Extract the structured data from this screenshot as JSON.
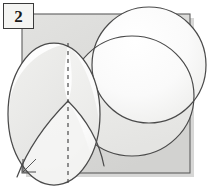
{
  "figure": {
    "label": "2",
    "caption": "",
    "canvas": {
      "width": 212,
      "height": 195,
      "background": "#ffffff"
    }
  },
  "label_box": {
    "text": "2",
    "fill": "#f4f4f2",
    "stroke": "#3a3a3a",
    "x": 3,
    "y": 3,
    "width": 31,
    "height": 26
  },
  "colors": {
    "square_fill": "#dcdcda",
    "square_stroke": "#5a5a5a",
    "square_shadow": "#9a9a98",
    "sphere_fill": "#fbfbfb",
    "sphere_fill_shaded": "#eeeeec",
    "sphere_fill_shaded_2": "#e6e6e4",
    "outline": "#4a4a4a",
    "dashed_line": "#444444",
    "paper": "#ffffff"
  },
  "shapes": {
    "square": {
      "name": "background-square",
      "x": 22,
      "y": 14,
      "width": 168,
      "height": 159,
      "fill": "#dcdcda",
      "stroke": "#5a5a5a"
    },
    "right_angle_mark": {
      "name": "right-angle-mark",
      "vertex_x": 23,
      "vertex_y": 172,
      "size": 13
    },
    "left_sphere": {
      "name": "left-sphere",
      "cx": 54,
      "cy": 114,
      "rx": 46,
      "ry": 71,
      "fill": "#fbfbfb",
      "stroke": "#4a4a4a"
    },
    "right_sphere": {
      "name": "right-sphere",
      "cx": 149,
      "cy": 65,
      "rx": 57,
      "ry": 58,
      "fill": "#fcfcfc",
      "stroke": "#4a4a4a"
    },
    "lower_right_arc_sphere": {
      "name": "lower-right-arc-sphere",
      "cx": 132,
      "cy": 96,
      "rx": 62,
      "ry": 60,
      "fill": "#f0f0ee",
      "stroke": "#4a4a4a"
    },
    "dashed_axis": {
      "name": "vertical-dashed-axis",
      "x": 68,
      "y1": 43,
      "y2": 186,
      "dash": "4 4",
      "stroke": "#444444"
    },
    "cusp_point": {
      "x": 68,
      "y": 101
    }
  },
  "annotations": {
    "figure_number": "2"
  }
}
